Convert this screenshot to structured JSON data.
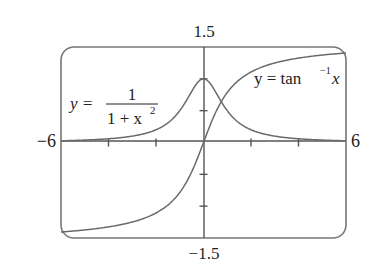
{
  "chart_data": {
    "type": "line",
    "title": "",
    "xlabel": "",
    "ylabel": "",
    "xlim": [
      -6,
      6
    ],
    "ylim": [
      -1.5,
      1.5
    ],
    "grid": false,
    "legend": "none",
    "tick_labels": {
      "x_min": "−6",
      "x_max": "6",
      "y_max": "1.5",
      "y_min": "−1.5"
    },
    "x_ticks": [
      -4,
      -2,
      2,
      4
    ],
    "y_ticks": [
      -1,
      -0.5,
      0.5,
      1
    ],
    "series": [
      {
        "name": "y = 1/(1+x^2)",
        "label_parts": {
          "lhs": "y =",
          "numerator": "1",
          "denominator": "1 + x",
          "exponent": "2"
        },
        "x": [
          -6,
          -5,
          -4,
          -3,
          -2,
          -1.5,
          -1,
          -0.5,
          0,
          0.5,
          1,
          1.5,
          2,
          3,
          4,
          5,
          6
        ],
        "values": [
          0.027,
          0.038,
          0.059,
          0.1,
          0.2,
          0.308,
          0.5,
          0.8,
          1.0,
          0.8,
          0.5,
          0.308,
          0.2,
          0.1,
          0.059,
          0.038,
          0.027
        ]
      },
      {
        "name": "y = tan^-1 x",
        "label_parts": {
          "lhs": "y = tan",
          "sup": "−1",
          "var": "x"
        },
        "x": [
          -6,
          -5,
          -4,
          -3,
          -2,
          -1.5,
          -1,
          -0.5,
          0,
          0.5,
          1,
          1.5,
          2,
          3,
          4,
          5,
          6
        ],
        "values": [
          -1.406,
          -1.373,
          -1.326,
          -1.249,
          -1.107,
          -0.983,
          -0.785,
          -0.464,
          0,
          0.464,
          0.785,
          0.983,
          1.107,
          1.249,
          1.326,
          1.373,
          1.406
        ]
      }
    ],
    "colors": {
      "curve": "#6a6a6a",
      "axis": "#555555",
      "frame": "#777777",
      "text": "#222222"
    }
  }
}
